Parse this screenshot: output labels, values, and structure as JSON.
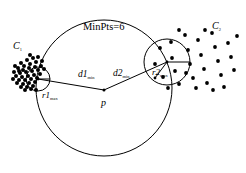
{
  "figure": {
    "background_color": "#ffffff",
    "stroke_color": "#000000"
  },
  "labels": {
    "minpts": "MinPts=6",
    "cluster1": "C",
    "cluster1_sub": "1",
    "cluster2": "C",
    "cluster2_sub": "2",
    "point_p": "p",
    "d1": "d1",
    "d1_sub": "min",
    "d2": "d2",
    "d2_sub": "min",
    "r1": "r1",
    "r1_sub": "max",
    "r2": "r2",
    "r2_sub": "max"
  },
  "chart_data": {
    "type": "scatter",
    "xlabel": "",
    "ylabel": "",
    "xlim": [
      0,
      246
    ],
    "ylim": [
      0,
      173
    ],
    "grid": false,
    "legend": "none",
    "annotations": [
      {
        "text": "MinPts=6",
        "x": 110,
        "y": 27
      },
      {
        "text": "C1",
        "x": 18,
        "y": 46
      },
      {
        "text": "C2",
        "x": 218,
        "y": 26
      },
      {
        "text": "p",
        "x": 104,
        "y": 103
      },
      {
        "text": "d1min",
        "x": 85,
        "y": 75
      },
      {
        "text": "d2min",
        "x": 120,
        "y": 74
      },
      {
        "text": "r1max",
        "x": 48,
        "y": 96
      },
      {
        "text": "r2max",
        "x": 158,
        "y": 73
      }
    ],
    "circles": [
      {
        "name": "minpts-neighborhood",
        "cx": 104,
        "cy": 88,
        "r": 68,
        "fill": "none",
        "stroke": "#000000"
      },
      {
        "name": "r1max-circle",
        "cx": 38,
        "cy": 79,
        "r": 12,
        "fill": "none",
        "stroke": "#000000"
      },
      {
        "name": "r2max-circle",
        "cx": 167,
        "cy": 62,
        "r": 23,
        "fill": "none",
        "stroke": "#000000"
      }
    ],
    "segments": [
      {
        "name": "d1min-segment",
        "x1": 104,
        "y1": 90,
        "x2": 38,
        "y2": 79
      },
      {
        "name": "d2min-segment",
        "x1": 104,
        "y1": 90,
        "x2": 167,
        "y2": 62
      },
      {
        "name": "r1max-radius",
        "x1": 38,
        "y1": 79,
        "x2": 50,
        "y2": 79
      },
      {
        "name": "r2max-radius",
        "x1": 167,
        "y1": 62,
        "x2": 190,
        "y2": 62
      },
      {
        "name": "r2max-leader",
        "x1": 155,
        "y1": 78,
        "x2": 167,
        "y2": 62
      }
    ],
    "series": [
      {
        "name": "C1",
        "marker": "filled-circle",
        "color": "#000000",
        "points": [
          [
            21,
            63
          ],
          [
            27,
            60
          ],
          [
            33,
            58
          ],
          [
            38,
            57
          ],
          [
            24,
            66
          ],
          [
            30,
            64
          ],
          [
            36,
            62
          ],
          [
            42,
            61
          ],
          [
            18,
            68
          ],
          [
            23,
            70
          ],
          [
            29,
            68
          ],
          [
            35,
            67
          ],
          [
            41,
            66
          ],
          [
            20,
            73
          ],
          [
            26,
            72
          ],
          [
            32,
            71
          ],
          [
            38,
            70
          ],
          [
            16,
            76
          ],
          [
            22,
            77
          ],
          [
            28,
            76
          ],
          [
            34,
            75
          ],
          [
            40,
            74
          ],
          [
            19,
            80
          ],
          [
            25,
            80
          ],
          [
            31,
            79
          ],
          [
            37,
            78
          ],
          [
            17,
            83
          ],
          [
            23,
            84
          ],
          [
            29,
            83
          ],
          [
            35,
            82
          ],
          [
            21,
            87
          ],
          [
            27,
            87
          ],
          [
            33,
            86
          ],
          [
            25,
            90
          ],
          [
            31,
            89
          ],
          [
            19,
            71
          ],
          [
            14,
            72
          ],
          [
            36,
            90
          ],
          [
            30,
            55
          ],
          [
            44,
            69
          ],
          [
            13,
            79
          ],
          [
            15,
            66
          ]
        ]
      },
      {
        "name": "C2",
        "marker": "filled-circle",
        "color": "#000000",
        "points": [
          [
            155,
            64
          ],
          [
            160,
            48
          ],
          [
            163,
            77
          ],
          [
            171,
            42
          ],
          [
            172,
            58
          ],
          [
            175,
            71
          ],
          [
            179,
            84
          ],
          [
            185,
            35
          ],
          [
            188,
            50
          ],
          [
            190,
            64
          ],
          [
            193,
            78
          ],
          [
            198,
            40
          ],
          [
            201,
            55
          ],
          [
            204,
            69
          ],
          [
            207,
            83
          ],
          [
            212,
            33
          ],
          [
            215,
            47
          ],
          [
            218,
            61
          ],
          [
            221,
            75
          ],
          [
            228,
            43
          ],
          [
            231,
            57
          ],
          [
            234,
            70
          ],
          [
            237,
            36
          ],
          [
            168,
            88
          ],
          [
            196,
            88
          ],
          [
            224,
            87
          ],
          [
            205,
            30
          ],
          [
            186,
            73
          ],
          [
            213,
            90
          ],
          [
            179,
            30
          ]
        ]
      }
    ]
  }
}
